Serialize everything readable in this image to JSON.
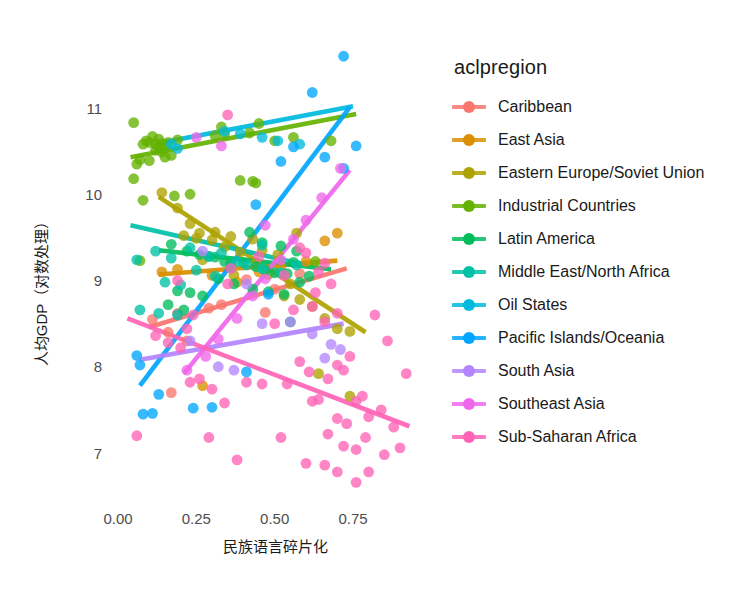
{
  "chart_data": {
    "type": "scatter",
    "title": "",
    "xlabel": "民族语言碎片化",
    "ylabel": "人均GDP（对数处理）",
    "xlim": [
      -0.06,
      0.99
    ],
    "ylim": [
      6.45,
      11.62
    ],
    "xticks": [
      "0.00",
      "0.25",
      "0.50",
      "0.75"
    ],
    "xtick_values": [
      0.0,
      0.25,
      0.5,
      0.75
    ],
    "yticks": [
      "7",
      "8",
      "9",
      "10",
      "11"
    ],
    "ytick_values": [
      7,
      8,
      9,
      10,
      11
    ],
    "grid": false,
    "legend_position": "right",
    "legend_title": "aclpregion",
    "series": [
      {
        "name": "Caribbean",
        "color": "#F8766D",
        "points": [
          [
            0.11,
            8.55
          ],
          [
            0.16,
            8.4
          ],
          [
            0.19,
            8.62
          ],
          [
            0.22,
            8.3
          ],
          [
            0.29,
            8.68
          ],
          [
            0.33,
            8.72
          ],
          [
            0.41,
            9.01
          ],
          [
            0.47,
            8.63
          ],
          [
            0.5,
            8.9
          ],
          [
            0.58,
            9.08
          ],
          [
            0.17,
            7.7
          ]
        ],
        "trend": {
          "x0": 0.1,
          "y0": 8.46,
          "x1": 0.73,
          "y1": 9.14
        }
      },
      {
        "name": "East Asia",
        "color": "#DB8E00",
        "points": [
          [
            0.14,
            9.1
          ],
          [
            0.19,
            9.13
          ],
          [
            0.3,
            9.06
          ],
          [
            0.38,
            8.98
          ],
          [
            0.45,
            9.1
          ],
          [
            0.52,
            9.16
          ],
          [
            0.6,
            9.22
          ],
          [
            0.66,
            9.46
          ],
          [
            0.7,
            9.55
          ],
          [
            0.27,
            7.78
          ]
        ],
        "trend": {
          "x0": 0.13,
          "y0": 9.07,
          "x1": 0.7,
          "y1": 9.23
        }
      },
      {
        "name": "Eastern Europe/Soviet Union",
        "color": "#AEA200",
        "points": [
          [
            0.14,
            10.02
          ],
          [
            0.19,
            9.84
          ],
          [
            0.23,
            9.66
          ],
          [
            0.26,
            9.55
          ],
          [
            0.3,
            9.47
          ],
          [
            0.34,
            9.39
          ],
          [
            0.39,
            9.33
          ],
          [
            0.44,
            9.21
          ],
          [
            0.31,
            9.56
          ],
          [
            0.36,
            9.51
          ],
          [
            0.27,
            9.24
          ],
          [
            0.43,
            9.48
          ],
          [
            0.48,
            9.07
          ],
          [
            0.53,
            8.82
          ],
          [
            0.58,
            8.78
          ],
          [
            0.62,
            8.7
          ],
          [
            0.66,
            8.56
          ],
          [
            0.7,
            8.44
          ],
          [
            0.74,
            8.41
          ],
          [
            0.21,
            9.52
          ],
          [
            0.25,
            9.49
          ],
          [
            0.46,
            9.35
          ],
          [
            0.51,
            9.3
          ],
          [
            0.55,
            8.96
          ],
          [
            0.64,
            7.92
          ],
          [
            0.74,
            7.66
          ],
          [
            0.57,
            9.55
          ],
          [
            0.37,
            9.06
          ]
        ],
        "trend": {
          "x0": 0.13,
          "y0": 9.97,
          "x1": 0.79,
          "y1": 8.4
        }
      },
      {
        "name": "Industrial Countries",
        "color": "#64B200",
        "points": [
          [
            0.05,
            10.83
          ],
          [
            0.08,
            10.58
          ],
          [
            0.09,
            10.62
          ],
          [
            0.1,
            10.6
          ],
          [
            0.11,
            10.67
          ],
          [
            0.12,
            10.58
          ],
          [
            0.12,
            10.51
          ],
          [
            0.13,
            10.55
          ],
          [
            0.13,
            10.64
          ],
          [
            0.14,
            10.49
          ],
          [
            0.14,
            10.59
          ],
          [
            0.15,
            10.57
          ],
          [
            0.15,
            10.43
          ],
          [
            0.16,
            10.6
          ],
          [
            0.17,
            10.45
          ],
          [
            0.07,
            10.4
          ],
          [
            0.06,
            10.35
          ],
          [
            0.1,
            10.39
          ],
          [
            0.19,
            10.63
          ],
          [
            0.31,
            10.68
          ],
          [
            0.33,
            10.78
          ],
          [
            0.34,
            10.7
          ],
          [
            0.42,
            10.71
          ],
          [
            0.45,
            10.82
          ],
          [
            0.5,
            10.62
          ],
          [
            0.56,
            10.66
          ],
          [
            0.68,
            10.62
          ],
          [
            0.05,
            10.18
          ],
          [
            0.08,
            9.93
          ],
          [
            0.18,
            9.98
          ],
          [
            0.23,
            10.0
          ],
          [
            0.39,
            10.16
          ],
          [
            0.43,
            10.15
          ],
          [
            0.44,
            10.13
          ],
          [
            0.07,
            9.23
          ],
          [
            0.63,
            9.22
          ]
        ],
        "trend": {
          "x0": 0.04,
          "y0": 10.43,
          "x1": 0.76,
          "y1": 10.93
        }
      },
      {
        "name": "Latin America",
        "color": "#00BD5C",
        "points": [
          [
            0.17,
            9.42
          ],
          [
            0.22,
            9.34
          ],
          [
            0.26,
            9.3
          ],
          [
            0.29,
            9.28
          ],
          [
            0.31,
            9.27
          ],
          [
            0.34,
            9.22
          ],
          [
            0.36,
            9.19
          ],
          [
            0.4,
            9.21
          ],
          [
            0.44,
            9.16
          ],
          [
            0.47,
            9.12
          ],
          [
            0.5,
            9.09
          ],
          [
            0.54,
            9.08
          ],
          [
            0.19,
            8.88
          ],
          [
            0.23,
            8.86
          ],
          [
            0.27,
            8.82
          ],
          [
            0.42,
            9.56
          ],
          [
            0.46,
            9.44
          ],
          [
            0.52,
            9.4
          ],
          [
            0.57,
            9.34
          ],
          [
            0.61,
            9.05
          ],
          [
            0.32,
            9.02
          ],
          [
            0.37,
            8.96
          ],
          [
            0.56,
            9.21
          ],
          [
            0.16,
            8.72
          ],
          [
            0.21,
            8.66
          ],
          [
            0.48,
            8.87
          ],
          [
            0.53,
            8.84
          ],
          [
            0.55,
            8.52
          ],
          [
            0.58,
            8.98
          ],
          [
            0.43,
            8.9
          ]
        ],
        "trend": {
          "x0": 0.13,
          "y0": 9.35,
          "x1": 0.68,
          "y1": 9.13
        }
      },
      {
        "name": "Middle East/North Africa",
        "color": "#00C1A7",
        "points": [
          [
            0.06,
            9.24
          ],
          [
            0.12,
            9.34
          ],
          [
            0.17,
            9.26
          ],
          [
            0.23,
            9.38
          ],
          [
            0.29,
            9.28
          ],
          [
            0.33,
            9.32
          ],
          [
            0.38,
            9.22
          ],
          [
            0.41,
            9.18
          ],
          [
            0.15,
            8.98
          ],
          [
            0.2,
            8.95
          ],
          [
            0.25,
            9.12
          ],
          [
            0.31,
            9.05
          ],
          [
            0.46,
            9.14
          ],
          [
            0.52,
            9.09
          ],
          [
            0.57,
            9.18
          ],
          [
            0.07,
            8.66
          ],
          [
            0.13,
            8.62
          ],
          [
            0.19,
            8.6
          ],
          [
            0.46,
            9.41
          ],
          [
            0.36,
            9.15
          ]
        ],
        "trend": {
          "x0": 0.04,
          "y0": 9.64,
          "x1": 0.6,
          "y1": 9.18
        }
      },
      {
        "name": "Oil States",
        "color": "#00BADE",
        "points": [
          [
            0.17,
            10.58
          ],
          [
            0.34,
            10.73
          ],
          [
            0.39,
            10.7
          ],
          [
            0.46,
            10.66
          ],
          [
            0.51,
            10.62
          ],
          [
            0.58,
            10.58
          ],
          [
            0.19,
            10.53
          ]
        ],
        "trend": {
          "x0": 0.14,
          "y0": 10.6,
          "x1": 0.75,
          "y1": 11.02
        }
      },
      {
        "name": "Pacific Islands/Oceania",
        "color": "#00A6FF",
        "points": [
          [
            0.06,
            8.13
          ],
          [
            0.07,
            8.02
          ],
          [
            0.08,
            7.45
          ],
          [
            0.11,
            7.46
          ],
          [
            0.13,
            7.68
          ],
          [
            0.24,
            7.52
          ],
          [
            0.3,
            7.53
          ],
          [
            0.41,
            7.94
          ],
          [
            0.48,
            8.84
          ],
          [
            0.56,
            10.55
          ],
          [
            0.62,
            11.18
          ],
          [
            0.72,
            11.6
          ],
          [
            0.52,
            10.38
          ],
          [
            0.72,
            10.3
          ],
          [
            0.44,
            9.88
          ],
          [
            0.66,
            10.43
          ],
          [
            0.76,
            10.56
          ]
        ],
        "trend": {
          "x0": 0.07,
          "y0": 7.78,
          "x1": 0.74,
          "y1": 11.01
        }
      },
      {
        "name": "South Asia",
        "color": "#B385FF",
        "points": [
          [
            0.23,
            8.3
          ],
          [
            0.32,
            8.0
          ],
          [
            0.37,
            7.96
          ],
          [
            0.46,
            8.5
          ],
          [
            0.55,
            8.52
          ],
          [
            0.62,
            8.38
          ],
          [
            0.66,
            8.1
          ],
          [
            0.68,
            8.26
          ],
          [
            0.71,
            8.2
          ],
          [
            0.27,
            9.34
          ],
          [
            0.41,
            8.96
          ]
        ],
        "trend": {
          "x0": 0.07,
          "y0": 8.08,
          "x1": 0.72,
          "y1": 8.5
        }
      },
      {
        "name": "Southeast Asia",
        "color": "#EF67EB",
        "points": [
          [
            0.22,
            7.96
          ],
          [
            0.28,
            8.12
          ],
          [
            0.32,
            8.32
          ],
          [
            0.38,
            8.56
          ],
          [
            0.43,
            8.82
          ],
          [
            0.47,
            9.02
          ],
          [
            0.52,
            9.24
          ],
          [
            0.56,
            9.48
          ],
          [
            0.6,
            9.7
          ],
          [
            0.65,
            9.96
          ],
          [
            0.71,
            10.3
          ],
          [
            0.33,
            10.56
          ],
          [
            0.25,
            10.66
          ],
          [
            0.47,
            9.64
          ]
        ],
        "trend": {
          "x0": 0.21,
          "y0": 7.92,
          "x1": 0.74,
          "y1": 10.28
        }
      },
      {
        "name": "Sub-Saharan Africa",
        "color": "#FF63B6",
        "points": [
          [
            0.06,
            7.2
          ],
          [
            0.12,
            8.36
          ],
          [
            0.16,
            8.28
          ],
          [
            0.2,
            8.22
          ],
          [
            0.23,
            7.82
          ],
          [
            0.26,
            7.86
          ],
          [
            0.3,
            7.74
          ],
          [
            0.34,
            7.58
          ],
          [
            0.19,
            9.0
          ],
          [
            0.35,
            8.96
          ],
          [
            0.22,
            8.44
          ],
          [
            0.29,
            7.18
          ],
          [
            0.41,
            7.82
          ],
          [
            0.46,
            7.8
          ],
          [
            0.54,
            7.8
          ],
          [
            0.52,
            7.18
          ],
          [
            0.38,
            6.92
          ],
          [
            0.62,
            8.7
          ],
          [
            0.66,
            9.2
          ],
          [
            0.68,
            8.96
          ],
          [
            0.7,
            8.02
          ],
          [
            0.72,
            7.96
          ],
          [
            0.74,
            8.12
          ],
          [
            0.76,
            7.6
          ],
          [
            0.78,
            7.66
          ],
          [
            0.8,
            7.42
          ],
          [
            0.73,
            7.34
          ],
          [
            0.7,
            7.4
          ],
          [
            0.67,
            7.22
          ],
          [
            0.72,
            7.08
          ],
          [
            0.76,
            7.04
          ],
          [
            0.79,
            7.18
          ],
          [
            0.84,
            7.5
          ],
          [
            0.88,
            7.3
          ],
          [
            0.9,
            7.06
          ],
          [
            0.82,
            8.6
          ],
          [
            0.86,
            8.3
          ],
          [
            0.92,
            7.92
          ],
          [
            0.6,
            9.32
          ],
          [
            0.64,
            9.1
          ],
          [
            0.58,
            8.06
          ],
          [
            0.61,
            7.94
          ],
          [
            0.64,
            7.62
          ],
          [
            0.67,
            7.86
          ],
          [
            0.56,
            8.66
          ],
          [
            0.5,
            8.5
          ],
          [
            0.53,
            9.06
          ],
          [
            0.58,
            9.38
          ],
          [
            0.63,
            8.86
          ],
          [
            0.66,
            8.52
          ],
          [
            0.7,
            8.62
          ],
          [
            0.45,
            9.28
          ],
          [
            0.36,
            9.14
          ],
          [
            0.24,
            8.6
          ],
          [
            0.66,
            6.86
          ],
          [
            0.7,
            6.78
          ],
          [
            0.6,
            6.88
          ],
          [
            0.76,
            6.66
          ],
          [
            0.8,
            6.78
          ],
          [
            0.85,
            6.98
          ],
          [
            0.35,
            10.92
          ],
          [
            0.62,
            7.6
          ]
        ],
        "trend": {
          "x0": 0.03,
          "y0": 8.56,
          "x1": 0.93,
          "y1": 7.31
        }
      }
    ]
  },
  "legend": {
    "title": "aclpregion",
    "items": [
      {
        "label": "Caribbean",
        "color": "#F8766D"
      },
      {
        "label": "East Asia",
        "color": "#DB8E00"
      },
      {
        "label": "Eastern Europe/Soviet Union",
        "color": "#AEA200"
      },
      {
        "label": "Industrial Countries",
        "color": "#64B200"
      },
      {
        "label": "Latin America",
        "color": "#00BD5C"
      },
      {
        "label": "Middle East/North Africa",
        "color": "#00C1A7"
      },
      {
        "label": "Oil States",
        "color": "#00BADE"
      },
      {
        "label": "Pacific Islands/Oceania",
        "color": "#00A6FF"
      },
      {
        "label": "South Asia",
        "color": "#B385FF"
      },
      {
        "label": "Southeast Asia",
        "color": "#EF67EB"
      },
      {
        "label": "Sub-Saharan Africa",
        "color": "#FF63B6"
      }
    ]
  },
  "axes": {
    "x_label": "民族语言碎片化",
    "y_label": "人均GDP（对数处理）",
    "x_tick_labels": [
      "0.00",
      "0.25",
      "0.50",
      "0.75"
    ],
    "y_tick_labels": [
      "7",
      "8",
      "9",
      "10",
      "11"
    ]
  },
  "style": {
    "background": "#ffffff",
    "tick_text_color": "#4d4d4d",
    "axis_title_color": "#1a1a1a",
    "point_opacity": 0.78,
    "point_radius": 5.4,
    "trend_width": 4.6
  }
}
